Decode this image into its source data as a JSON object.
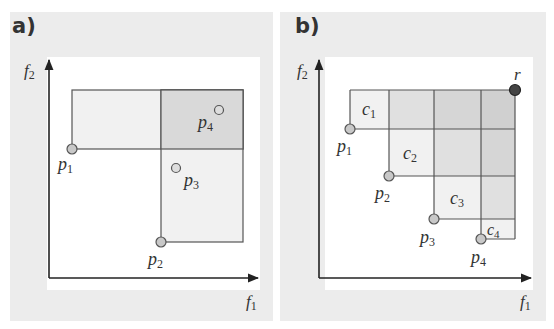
{
  "panels": [
    {
      "label": "a)",
      "x_axis_label": "f",
      "x_axis_sub": "1",
      "y_axis_label": "f",
      "y_axis_sub": "2",
      "points": [
        {
          "name": "p",
          "sub": "1"
        },
        {
          "name": "p",
          "sub": "2"
        },
        {
          "name": "p",
          "sub": "3"
        },
        {
          "name": "p",
          "sub": "4"
        }
      ]
    },
    {
      "label": "b)",
      "x_axis_label": "f",
      "x_axis_sub": "1",
      "y_axis_label": "f",
      "y_axis_sub": "2",
      "points": [
        {
          "name": "p",
          "sub": "1"
        },
        {
          "name": "p",
          "sub": "2"
        },
        {
          "name": "p",
          "sub": "3"
        },
        {
          "name": "p",
          "sub": "4"
        }
      ],
      "reference_point": "r",
      "cells": [
        {
          "name": "c",
          "sub": "1"
        },
        {
          "name": "c",
          "sub": "2"
        },
        {
          "name": "c",
          "sub": "3"
        },
        {
          "name": "c",
          "sub": "4"
        }
      ]
    }
  ],
  "colors": {
    "panel_bg": "#ececec",
    "plot_bg": "#ffffff",
    "line": "#555555",
    "fill_light": "#f1f1f1",
    "fill_mid": "#e0e0e0",
    "fill_dark": "#d3d3d3",
    "point_fill": "#c8c8c8",
    "ref_point_fill": "#444444"
  }
}
